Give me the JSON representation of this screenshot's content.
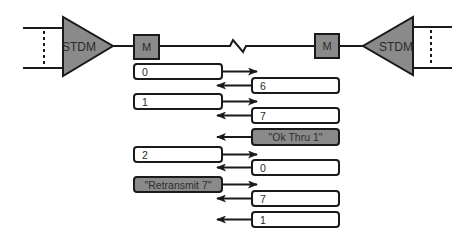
{
  "diagram": {
    "colors": {
      "line": "#1a1a1a",
      "device_fill": "#8a8a8a",
      "box_fill": "#ffffff",
      "control_fill": "#8a8a8a",
      "text": "#2a2a2a",
      "control_text": "#3a3a3a"
    },
    "left_mux": {
      "label": "STDM"
    },
    "right_mux": {
      "label": "STDM"
    },
    "left_modem": {
      "label": "M"
    },
    "right_modem": {
      "label": "M"
    },
    "messages": [
      {
        "id": "m1",
        "direction": "left-to-right",
        "label": "0",
        "type": "frame"
      },
      {
        "id": "m2",
        "direction": "right-to-left",
        "label": "6",
        "type": "frame"
      },
      {
        "id": "m3",
        "direction": "left-to-right",
        "label": "1",
        "type": "frame"
      },
      {
        "id": "m4",
        "direction": "right-to-left",
        "label": "7",
        "type": "frame"
      },
      {
        "id": "m5",
        "direction": "right-to-left",
        "label": "\"Ok Thru 1\"",
        "type": "control"
      },
      {
        "id": "m6",
        "direction": "left-to-right",
        "label": "2",
        "type": "frame"
      },
      {
        "id": "m7",
        "direction": "right-to-left",
        "label": "0",
        "type": "frame"
      },
      {
        "id": "m8",
        "direction": "left-to-right",
        "label": "\"Retransmit 7\"",
        "type": "control"
      },
      {
        "id": "m9",
        "direction": "right-to-left",
        "label": "7",
        "type": "frame"
      },
      {
        "id": "m10",
        "direction": "right-to-left",
        "label": "1",
        "type": "frame"
      }
    ]
  }
}
